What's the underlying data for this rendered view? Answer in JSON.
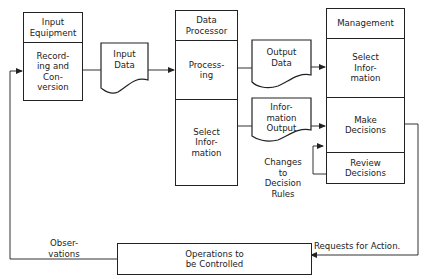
{
  "diagram": {
    "input_equipment": {
      "title": "Input\nEquipment",
      "sections": [
        "Record-\ning and\nCon-\nversion"
      ]
    },
    "input_data": {
      "label": "Input\nData"
    },
    "data_processor": {
      "title": "Data\nProcessor",
      "sections": [
        "Process-\ning",
        "Select\nInfor-\nmation"
      ]
    },
    "output_data": {
      "label": "Output\nData"
    },
    "information_output": {
      "label": "Infor-\nmation\nOutput"
    },
    "management": {
      "title": "Management",
      "sections": [
        "Select\nInfor-\nmation",
        "Make\nDecisions",
        "Review\nDecisions"
      ]
    },
    "operations": {
      "label": "Operations to\nbe Controlled"
    },
    "annotations": {
      "changes_rules": "Changes\nto\nDecision\nRules",
      "observations": "Obser-\nvations",
      "requests": "Requests for Action."
    }
  }
}
